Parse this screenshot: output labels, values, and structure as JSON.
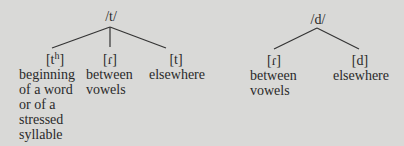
{
  "trees": [
    {
      "phoneme": "/t/",
      "allophones": [
        {
          "symbol": "[t",
          "sup": "h",
          "close": "]",
          "description": [
            "beginning",
            "of a word",
            "or of a",
            "stressed",
            "syllable"
          ]
        },
        {
          "symbol": "[ɾ]",
          "sup": "",
          "close": "",
          "description": [
            "between",
            "vowels"
          ]
        },
        {
          "symbol": "[t]",
          "sup": "",
          "close": "",
          "description": [
            "elsewhere"
          ]
        }
      ]
    },
    {
      "phoneme": "/d/",
      "allophones": [
        {
          "symbol": "[ɾ]",
          "description": [
            "between",
            "vowels"
          ]
        },
        {
          "symbol": "[d]",
          "description": [
            "elsewhere"
          ]
        }
      ]
    }
  ]
}
